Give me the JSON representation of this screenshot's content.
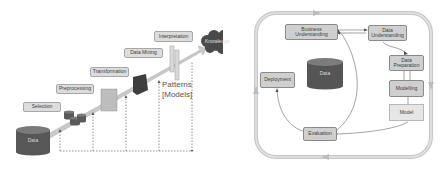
{
  "left_diagram": {
    "title": "KDD process",
    "data_label": "Data",
    "steps": [
      {
        "label": "Selection"
      },
      {
        "label": "Preprocessing"
      },
      {
        "label": "Transformation"
      },
      {
        "label": "Data Mining"
      },
      {
        "label": "Interpretation"
      }
    ],
    "knowledge_label": "Knowledge",
    "patterns_label_1": "Patterns",
    "patterns_label_2": "[Models]"
  },
  "right_diagram": {
    "title": "CRISP-DM cycle",
    "nodes": {
      "business_understanding": "Business Understanding",
      "data_understanding": "Data Understanding",
      "data_preparation": "Data Preparation",
      "modelling": "Modelling",
      "model": "Model",
      "evaluation": "Evaluation",
      "deployment": "Deployment",
      "data": "Data"
    }
  },
  "colors": {
    "box_fill": "#cfcfcf",
    "box_border": "#8a8a8a",
    "cylinder_dark": "#555555",
    "cycle_arrow": "#c8c8c8",
    "dotted": "#777777"
  }
}
